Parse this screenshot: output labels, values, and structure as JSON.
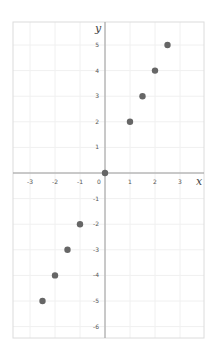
{
  "chart_data": {
    "type": "scatter",
    "title": "",
    "xlabel": "x",
    "ylabel": "y",
    "xlim": [
      -3.7,
      3.9
    ],
    "ylim": [
      -6.5,
      5.9
    ],
    "x_ticks": [
      -3,
      -2,
      -1,
      0,
      1,
      2,
      3
    ],
    "y_ticks": [
      -6,
      -5,
      -4,
      -3,
      -2,
      -1,
      1,
      2,
      3,
      4,
      5
    ],
    "x_tick_labels": [
      "-3",
      "-2",
      "-1",
      "0",
      "1",
      "2",
      "3"
    ],
    "y_tick_labels": [
      "-6",
      "-5",
      "-4",
      "-3",
      "-2",
      "-1",
      "1",
      "2",
      "3",
      "4",
      "5"
    ],
    "grid": true,
    "legend": null,
    "series": [
      {
        "name": "points",
        "color": "#666666",
        "points": [
          {
            "x": -2.5,
            "y": -5
          },
          {
            "x": -2,
            "y": -4
          },
          {
            "x": -1.5,
            "y": -3
          },
          {
            "x": -1,
            "y": -2
          },
          {
            "x": 0,
            "y": 0
          },
          {
            "x": 1,
            "y": 2
          },
          {
            "x": 1.5,
            "y": 3
          },
          {
            "x": 2,
            "y": 4
          },
          {
            "x": 2.5,
            "y": 5
          }
        ]
      }
    ]
  },
  "labels": {
    "x_axis": "x",
    "y_axis": "y"
  },
  "colors": {
    "frame": "#dcdcdc",
    "grid": "#f0f0f0",
    "axis": "#9a9a9a",
    "tick_text": "#555555",
    "point": "#666666"
  }
}
